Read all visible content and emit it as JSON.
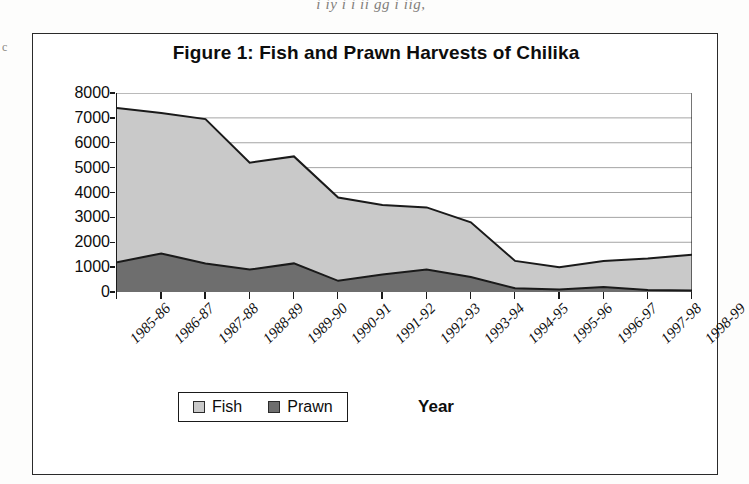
{
  "page": {
    "bleed_text": "i      iy    i           i                  ii    gg     i      iig,",
    "left_margin_mark": "c"
  },
  "figure": {
    "title": "Figure 1: Fish and Prawn Harvests of Chilika",
    "legend": [
      {
        "label": "Fish",
        "color": "#c9c9c9"
      },
      {
        "label": "Prawn",
        "color": "#6e6e6e"
      }
    ]
  },
  "chart_data": {
    "type": "area",
    "stacked": true,
    "title": "Figure 1: Fish and Prawn Harvests of Chilika",
    "xlabel": "Year",
    "ylabel": "M.T",
    "ylim": [
      0,
      8000
    ],
    "ytick_step": 1000,
    "yticks": [
      "8000",
      "7000",
      "6000",
      "5000",
      "4000",
      "3000",
      "2000",
      "1000",
      "0"
    ],
    "grid": "horizontal",
    "legend_position": "bottom-left",
    "categories": [
      "1985-86",
      "1986-87",
      "1987-88",
      "1988-89",
      "1989-90",
      "1990-91",
      "1991-92",
      "1992-93",
      "1993-94",
      "1994-95",
      "1995-96",
      "1996-97",
      "1997-98",
      "1998-99"
    ],
    "series": [
      {
        "name": "Prawn",
        "color": "#6e6e6e",
        "values": [
          1200,
          1550,
          1150,
          900,
          1150,
          450,
          700,
          900,
          600,
          150,
          100,
          200,
          80,
          60
        ]
      },
      {
        "name": "Fish",
        "color": "#c9c9c9",
        "values": [
          6200,
          5650,
          5800,
          4300,
          4300,
          3350,
          2800,
          2500,
          2200,
          1100,
          900,
          1050,
          1270,
          1440
        ]
      }
    ],
    "totals": [
      7400,
      7200,
      6950,
      5200,
      5450,
      3800,
      3500,
      3400,
      2800,
      1250,
      1000,
      1250,
      1350,
      1500
    ]
  }
}
